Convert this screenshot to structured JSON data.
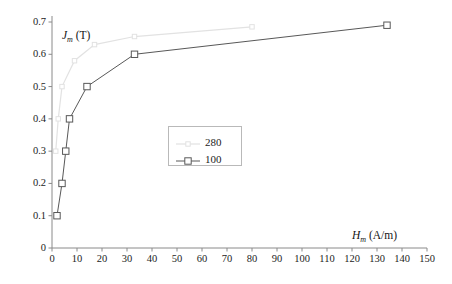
{
  "chart_data": {
    "type": "line",
    "title": "",
    "xlabel": "H_m (A/m)",
    "ylabel": "J_m (T)",
    "xlabel_parts": {
      "symbol": "H",
      "sub": "m",
      "unit": "(A/m)"
    },
    "ylabel_parts": {
      "symbol": "J",
      "sub": "m",
      "unit": "(T)"
    },
    "xlim": [
      0,
      150
    ],
    "ylim": [
      0,
      0.7
    ],
    "xticks": [
      0,
      10,
      20,
      30,
      40,
      50,
      60,
      70,
      80,
      90,
      100,
      110,
      120,
      130,
      140,
      150
    ],
    "yticks": [
      0,
      0.1,
      0.2,
      0.3,
      0.4,
      0.5,
      0.6,
      0.7
    ],
    "xtick_labels": [
      "0",
      "10",
      "20",
      "30",
      "40",
      "50",
      "60",
      "70",
      "80",
      "90",
      "100",
      "110",
      "120",
      "130",
      "140",
      "150"
    ],
    "ytick_labels": [
      "0",
      "0.1",
      "0.2",
      "0.3",
      "0.4",
      "0.5",
      "0.6",
      "0.7"
    ],
    "grid": false,
    "legend_position": "center",
    "series": [
      {
        "name": "280",
        "color": "#e2e2e2",
        "marker": "square-open",
        "x": [
          1.5,
          2.5,
          4,
          9,
          17,
          33,
          80
        ],
        "y": [
          0.3,
          0.4,
          0.5,
          0.58,
          0.63,
          0.655,
          0.685
        ]
      },
      {
        "name": "100",
        "color": "#585858",
        "marker": "square-open",
        "x": [
          2,
          4,
          5.5,
          7,
          14,
          33,
          134
        ],
        "y": [
          0.1,
          0.2,
          0.3,
          0.4,
          0.5,
          0.6,
          0.69
        ]
      }
    ]
  },
  "legend": {
    "entries": [
      {
        "label": "280"
      },
      {
        "label": "100"
      }
    ]
  }
}
